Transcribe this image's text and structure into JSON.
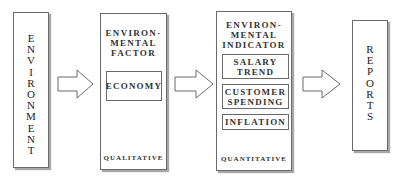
{
  "diagram": {
    "nodes": [
      {
        "id": "environment",
        "label": "ENVIRONMENT",
        "orientation": "vertical"
      },
      {
        "id": "environmental-factor",
        "title": "ENVIRON-\nMENTAL\nFACTOR",
        "title_lines": [
          "ENVIRON-",
          "MENTAL",
          "FACTOR"
        ],
        "items": [
          "ECONOMY"
        ],
        "footer": "QUALITATIVE"
      },
      {
        "id": "environmental-indicator",
        "title_lines": [
          "ENVIRON-",
          "MENTAL",
          "INDICATOR"
        ],
        "items": [
          {
            "lines": [
              "SALARY",
              "TREND"
            ]
          },
          {
            "lines": [
              "CUSTOMER",
              "SPENDING"
            ]
          },
          {
            "lines": [
              "INFLATION"
            ]
          }
        ],
        "footer": "QUANTITATIVE"
      },
      {
        "id": "reports",
        "label": "REPORTS",
        "orientation": "vertical"
      }
    ],
    "edges": [
      {
        "from": "environment",
        "to": "environmental-factor",
        "style": "block-arrow"
      },
      {
        "from": "environmental-factor",
        "to": "environmental-indicator",
        "style": "block-arrow"
      },
      {
        "from": "environmental-indicator",
        "to": "reports",
        "style": "block-arrow"
      }
    ],
    "colors": {
      "border": "#6a6a6a",
      "shadow": "#a8a8a8",
      "text": "#222222",
      "background": "#ffffff"
    }
  }
}
